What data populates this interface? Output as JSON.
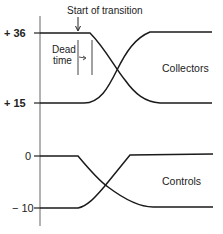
{
  "diagram": {
    "annotations": {
      "start_of_transition": "Start of transition",
      "dead_time_line1": "Dead",
      "dead_time_line2": "time"
    },
    "groups": [
      {
        "label": "Collectors",
        "high_value": "+ 36",
        "low_value": "+ 15"
      },
      {
        "label": "Controls",
        "high_value": "0",
        "low_value": "− 10"
      }
    ],
    "colors": {
      "line": "#1a1a1a",
      "axis": "#555555",
      "background": "#ffffff"
    }
  }
}
